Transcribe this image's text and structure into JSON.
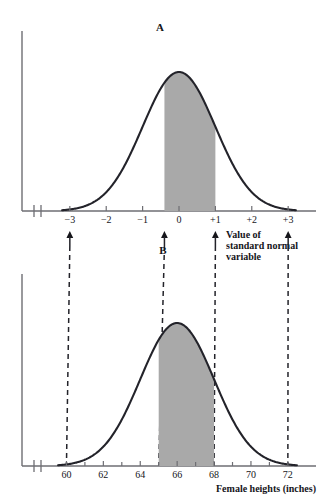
{
  "figure": {
    "panel_a": {
      "label": "A",
      "axis_caption": [
        "Value of",
        "standard normal",
        "variable"
      ],
      "tick_labels": [
        "−3",
        "−2",
        "−1",
        "0",
        "+1",
        "+2",
        "+3"
      ],
      "tick_values": [
        -3,
        -2,
        -1,
        0,
        1,
        2,
        3
      ],
      "shaded_from": -0.4,
      "shaded_to": 1.0
    },
    "panel_b": {
      "label": "B",
      "axis_caption": "Female heights (inches)",
      "tick_labels": [
        "60",
        "62",
        "64",
        "66",
        "68",
        "70",
        "72"
      ],
      "tick_values": [
        60,
        62,
        64,
        66,
        68,
        70,
        72
      ],
      "minor_tick_values": [
        61,
        63,
        65,
        67,
        69,
        71
      ],
      "shaded_from": 65.0,
      "shaded_to": 68.0
    },
    "connectors": [
      {
        "z": -3.0,
        "height": 60.0
      },
      {
        "z": -0.4,
        "height": 65.0
      },
      {
        "z": 1.0,
        "height": 68.0
      },
      {
        "z": 3.0,
        "height": 72.0
      }
    ],
    "colors": {
      "curve": "#23232a",
      "shade": "#a9a9a9",
      "axis": "#6e6e73",
      "text": "#15151a",
      "background": "#ffffff"
    }
  },
  "chart_data": {
    "type": "area",
    "title": "",
    "charts": [
      {
        "id": "A",
        "type": "area",
        "title": "A",
        "xlabel": "Value of standard normal variable",
        "ylabel": "",
        "distribution": "standard normal",
        "mean": 0,
        "sd": 1,
        "xlim": [
          -3.6,
          3.6
        ],
        "xticks": [
          -3,
          -2,
          -1,
          0,
          1,
          2,
          3
        ],
        "xticklabels": [
          "−3",
          "−2",
          "−1",
          "0",
          "+1",
          "+2",
          "+3"
        ],
        "shaded_interval": [
          -0.4,
          1.0
        ],
        "grid": false,
        "legend": null
      },
      {
        "id": "B",
        "type": "area",
        "title": "B",
        "xlabel": "Female heights (inches)",
        "ylabel": "",
        "distribution": "normal",
        "mean": 66,
        "sd": 2,
        "xlim": [
          59.0,
          73.2
        ],
        "xticks": [
          60,
          62,
          64,
          66,
          68,
          70,
          72
        ],
        "xticklabels": [
          "60",
          "62",
          "64",
          "66",
          "68",
          "70",
          "72"
        ],
        "minor_xticks": [
          61,
          63,
          65,
          67,
          69,
          71
        ],
        "shaded_interval": [
          65.0,
          68.0
        ],
        "grid": false,
        "legend": null
      }
    ],
    "mapping": {
      "description": "z = (height - 66) / 2",
      "pairs": [
        {
          "z": -3.0,
          "height": 60.0
        },
        {
          "z": -0.4,
          "height": 65.0
        },
        {
          "z": 1.0,
          "height": 68.0
        },
        {
          "z": 3.0,
          "height": 72.0
        }
      ]
    }
  }
}
